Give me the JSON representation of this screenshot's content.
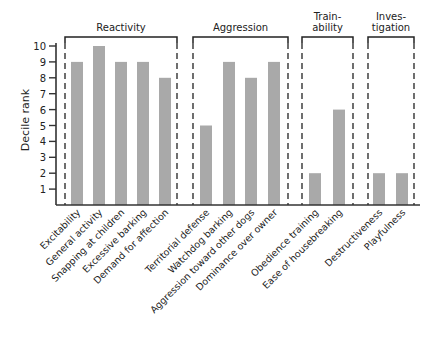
{
  "chart_data": {
    "type": "bar",
    "title": "",
    "xlabel": "",
    "ylabel": "Decile rank",
    "ylim": [
      0,
      10
    ],
    "yticks": [
      1,
      2,
      3,
      4,
      5,
      6,
      7,
      8,
      9,
      10
    ],
    "grid": false,
    "legend": null,
    "bar_color": "#a9a9a9",
    "groups": [
      {
        "label": "Reactivity",
        "label_lines": [
          "Reactivity"
        ],
        "categories": [
          "Excitability",
          "General activity",
          "Snapping at children",
          "Excessive barking",
          "Demand for affection"
        ],
        "values": [
          9,
          10,
          9,
          9,
          8
        ]
      },
      {
        "label": "Aggression",
        "label_lines": [
          "Aggression"
        ],
        "categories": [
          "Territorial defense",
          "Watchdog barking",
          "Aggression toward other dogs",
          "Dominance over owner"
        ],
        "values": [
          5,
          9,
          8,
          9
        ]
      },
      {
        "label": "Trainability",
        "label_lines": [
          "Train-",
          "ability"
        ],
        "categories": [
          "Obedience training",
          "Ease of housebreaking"
        ],
        "values": [
          2,
          6
        ]
      },
      {
        "label": "Investigation",
        "label_lines": [
          "Inves-",
          "tigation"
        ],
        "categories": [
          "Destructiveness",
          "Playfulness"
        ],
        "values": [
          2,
          2
        ]
      }
    ],
    "categories": [
      "Excitability",
      "General activity",
      "Snapping at children",
      "Excessive barking",
      "Demand for affection",
      "Territorial defense",
      "Watchdog barking",
      "Aggression toward other dogs",
      "Dominance over owner",
      "Obedience training",
      "Ease of housebreaking",
      "Destructiveness",
      "Playfulness"
    ],
    "values": [
      9,
      10,
      9,
      9,
      8,
      5,
      9,
      8,
      9,
      2,
      6,
      2,
      2
    ]
  }
}
